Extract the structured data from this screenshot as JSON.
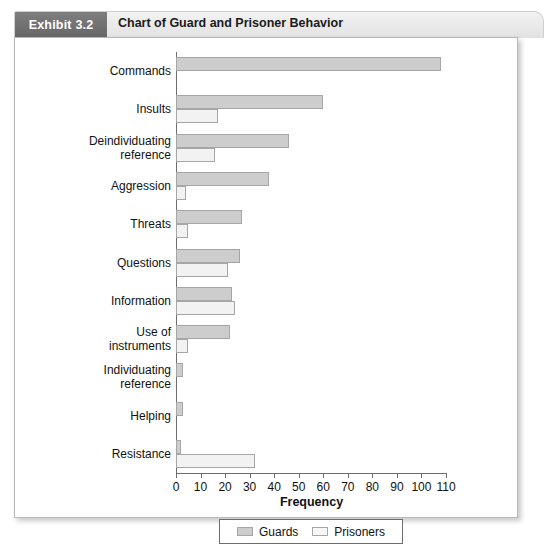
{
  "header": {
    "badge_label": "Exhibit 3.2",
    "title": "Chart of Guard and Prisoner Behavior"
  },
  "chart_data": {
    "type": "bar",
    "orientation": "horizontal",
    "title": "Chart of Guard and Prisoner Behavior",
    "xlabel": "Frequency",
    "ylabel": "",
    "xlim": [
      0,
      110
    ],
    "xticks": [
      0,
      10,
      20,
      30,
      40,
      50,
      60,
      70,
      80,
      90,
      100,
      110
    ],
    "grid": false,
    "legend_position": "bottom",
    "categories": [
      "Commands",
      "Insults",
      "Deindividuating reference",
      "Aggression",
      "Threats",
      "Questions",
      "Information",
      "Use of instruments",
      "Individuating reference",
      "Helping",
      "Resistance"
    ],
    "category_lines": [
      [
        "Commands"
      ],
      [
        "Insults"
      ],
      [
        "Deindividuating",
        "reference"
      ],
      [
        "Aggression"
      ],
      [
        "Threats"
      ],
      [
        "Questions"
      ],
      [
        "Information"
      ],
      [
        "Use of",
        "instruments"
      ],
      [
        "Individuating",
        "reference"
      ],
      [
        "Helping"
      ],
      [
        "Resistance"
      ]
    ],
    "series": [
      {
        "name": "Guards",
        "color": "#cdcdcd",
        "values": [
          108,
          60,
          46,
          38,
          27,
          26,
          23,
          22,
          3,
          3,
          2
        ]
      },
      {
        "name": "Prisoners",
        "color": "#f2f2f2",
        "values": [
          0,
          17,
          16,
          4,
          5,
          21,
          24,
          5,
          0,
          0,
          32
        ]
      }
    ]
  },
  "legend": {
    "items": [
      {
        "label": "Guards",
        "swatch": "guards"
      },
      {
        "label": "Prisoners",
        "swatch": "prisoners"
      }
    ]
  }
}
